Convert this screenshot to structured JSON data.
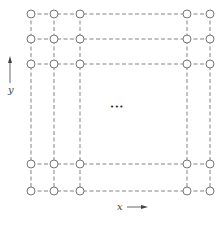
{
  "diagram": {
    "title": "",
    "columns_x": [
      31,
      54,
      80,
      187,
      210
    ],
    "rows_y": [
      14,
      39,
      64,
      164,
      191
    ],
    "node_radius": 4,
    "line_color": "#777777",
    "node_stroke": "#666666",
    "ellipsis": "•••",
    "axes": {
      "x_label": "x",
      "y_label": "y"
    }
  }
}
